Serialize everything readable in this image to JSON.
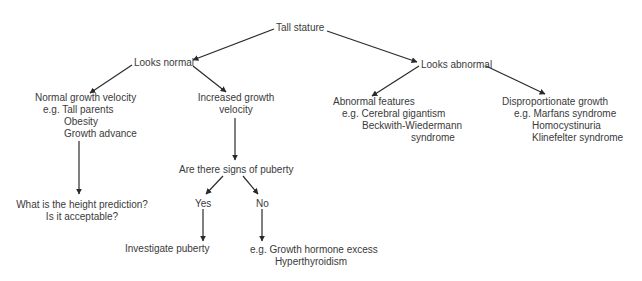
{
  "diagram": {
    "type": "flowchart",
    "root": "Tall stature",
    "nodes": {
      "tall_stature": {
        "label": "Tall stature"
      },
      "looks_normal": {
        "label": "Looks normal"
      },
      "looks_abnormal": {
        "label": "Looks abnormal"
      },
      "normal_growth": {
        "title": "Normal growth velocity",
        "lines": [
          "e.g. Tall parents",
          "Obesity",
          "Growth advance"
        ]
      },
      "increased_growth": {
        "lines": [
          "Increased growth",
          "velocity"
        ]
      },
      "abnormal_features": {
        "title": "Abnormal features",
        "lines": [
          "e.g. Cerebral gigantism",
          "Beckwith-Wiedermann",
          "syndrome"
        ]
      },
      "disproportionate": {
        "title": "Disproportionate growth",
        "lines": [
          "e.g. Marfans syndrome",
          "Homocystinuria",
          "Klinefelter syndrome"
        ]
      },
      "signs_of_puberty": {
        "label": "Are there signs of puberty"
      },
      "height_prediction": {
        "lines": [
          "What is the height prediction?",
          "Is it acceptable?"
        ]
      },
      "yes": {
        "label": "Yes"
      },
      "no": {
        "label": "No"
      },
      "investigate_puberty": {
        "label": "Investigate puberty"
      },
      "no_outcome": {
        "lines": [
          "e.g. Growth hormone excess",
          "Hyperthyroidism"
        ]
      }
    },
    "edges": [
      [
        "Tall stature",
        "Looks normal"
      ],
      [
        "Tall stature",
        "Looks abnormal"
      ],
      [
        "Looks normal",
        "Normal growth velocity"
      ],
      [
        "Looks normal",
        "Increased growth velocity"
      ],
      [
        "Looks abnormal",
        "Abnormal features"
      ],
      [
        "Looks abnormal",
        "Disproportionate growth"
      ],
      [
        "Normal growth velocity",
        "What is the height prediction?"
      ],
      [
        "Increased growth velocity",
        "Are there signs of puberty"
      ],
      [
        "Are there signs of puberty",
        "Yes"
      ],
      [
        "Are there signs of puberty",
        "No"
      ],
      [
        "Yes",
        "Investigate puberty"
      ],
      [
        "No",
        "e.g. Growth hormone excess"
      ]
    ],
    "colors": {
      "text": "#3a3a3a",
      "line": "#2a2a2a",
      "background": "#ffffff"
    }
  }
}
